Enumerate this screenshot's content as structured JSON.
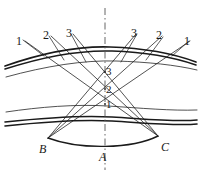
{
  "figure": {
    "type": "optical-ray-diagram",
    "background_color": "#ffffff",
    "ink_color": "#1a1a1a",
    "axis_color": "#555555",
    "width": 203,
    "height": 175
  },
  "labels": {
    "rays_left": [
      {
        "id": "ray-label-left-1",
        "text": "1",
        "x": 16,
        "y": 35
      },
      {
        "id": "ray-label-left-2",
        "text": "2",
        "x": 43,
        "y": 29
      },
      {
        "id": "ray-label-left-3",
        "text": "3",
        "x": 66,
        "y": 27
      }
    ],
    "rays_right": [
      {
        "id": "ray-label-right-3",
        "text": "3",
        "x": 131,
        "y": 27
      },
      {
        "id": "ray-label-right-2",
        "text": "2",
        "x": 156,
        "y": 29
      },
      {
        "id": "ray-label-right-1",
        "text": "1",
        "x": 184,
        "y": 35
      }
    ],
    "crossings": [
      {
        "id": "crossing-label-3",
        "text": "3",
        "x": 106,
        "y": 66
      },
      {
        "id": "crossing-label-2",
        "text": "2",
        "x": 106,
        "y": 84
      },
      {
        "id": "crossing-label-1",
        "text": "1",
        "x": 106,
        "y": 99
      }
    ],
    "vertices": [
      {
        "id": "vertex-label-b",
        "text": "B",
        "x": 39,
        "y": 143
      },
      {
        "id": "vertex-label-a",
        "text": "A",
        "x": 99,
        "y": 151
      },
      {
        "id": "vertex-label-c",
        "text": "C",
        "x": 161,
        "y": 141
      }
    ]
  },
  "axis": {
    "name": "optical-axis",
    "x": 105,
    "y_top": 8,
    "y_bottom": 170,
    "style": "dash-dot"
  },
  "geometry": {
    "vertex_b": {
      "x": 48,
      "y": 138
    },
    "vertex_c": {
      "x": 158,
      "y": 136
    },
    "vertex_a": {
      "x": 105,
      "y": 146
    },
    "crossing_points": [
      {
        "label": "3",
        "x": 105,
        "y": 72
      },
      {
        "label": "2",
        "x": 105,
        "y": 89
      },
      {
        "label": "1",
        "x": 105,
        "y": 104
      }
    ],
    "ray_endpoints_left": [
      {
        "label": "1",
        "x": 25,
        "y": 41
      },
      {
        "label": "2",
        "x": 51,
        "y": 36
      },
      {
        "label": "3",
        "x": 73,
        "y": 34
      }
    ],
    "ray_endpoints_right": [
      {
        "label": "3",
        "x": 136,
        "y": 34
      },
      {
        "label": "2",
        "x": 162,
        "y": 36
      },
      {
        "label": "1",
        "x": 190,
        "y": 41
      }
    ],
    "upper_band_curves": [
      {
        "name": "upper-curve-outer",
        "weight": "thick"
      },
      {
        "name": "upper-curve-inner",
        "weight": "thick"
      },
      {
        "name": "upper-curve-lower",
        "weight": "thin"
      }
    ],
    "lower_band_curves": [
      {
        "name": "lower-curve-upper",
        "weight": "thin"
      },
      {
        "name": "lower-curve-middle",
        "weight": "thick"
      },
      {
        "name": "lower-curve-outer",
        "weight": "thick"
      }
    ],
    "base_arc": {
      "name": "base-arc-bc",
      "from": "B",
      "to": "C"
    }
  }
}
